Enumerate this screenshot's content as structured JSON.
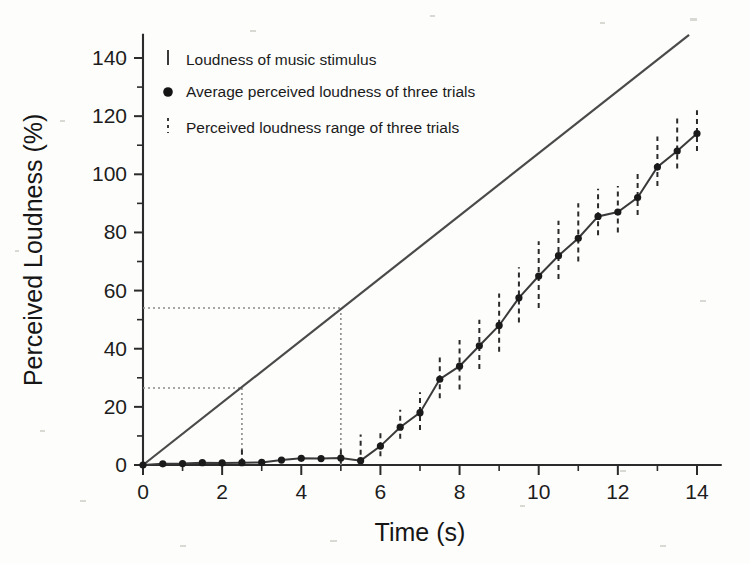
{
  "chart_data": {
    "type": "line",
    "title": "",
    "xlabel": "Time (s)",
    "ylabel": "Perceived Loudness (%)",
    "xlim": [
      0,
      14.6
    ],
    "ylim": [
      0,
      148
    ],
    "x_ticks": [
      0,
      2,
      4,
      6,
      8,
      10,
      12,
      14
    ],
    "x_tick_labels": [
      "0",
      "2",
      "4",
      "6",
      "8",
      "10",
      "12",
      "14"
    ],
    "x_minor_step": 1,
    "y_ticks": [
      0,
      20,
      40,
      60,
      80,
      100,
      120,
      140
    ],
    "y_tick_labels": [
      "0",
      "20",
      "40",
      "60",
      "80",
      "100",
      "120",
      "140"
    ],
    "y_minor_step": 10,
    "grid": false,
    "legend_position": "upper-left-inside",
    "series": [
      {
        "name": "Loudness of music stimulus",
        "type": "line",
        "style": "solid",
        "color": "#4a4a4a",
        "x": [
          0,
          13.8
        ],
        "values": [
          0,
          148
        ]
      },
      {
        "name": "Average perceived loudness of three trials",
        "type": "line-markers",
        "style": "solid-with-dots",
        "color": "#1a1a1a",
        "x": [
          0,
          0.5,
          1.0,
          1.5,
          2.0,
          2.5,
          3.0,
          3.5,
          4.0,
          4.5,
          5.0,
          5.5,
          6.0,
          6.5,
          7.0,
          7.5,
          8.0,
          8.5,
          9.0,
          9.5,
          10.0,
          10.5,
          11.0,
          11.5,
          12.0,
          12.5,
          13.0,
          13.5,
          14.0
        ],
        "values": [
          0,
          0.4,
          0.5,
          0.8,
          0.7,
          0.8,
          0.9,
          1.7,
          2.3,
          2.2,
          2.4,
          1.5,
          6.5,
          13.0,
          18.0,
          29.5,
          34.0,
          41.0,
          48.0,
          57.5,
          65.0,
          72.0,
          78.0,
          85.5,
          87.0,
          92.0,
          102.5,
          108.0,
          114.0
        ]
      },
      {
        "name": "Perceived loudness range of three trials",
        "type": "errorbar",
        "style": "dashed-vertical",
        "color": "#2a2a2a",
        "x": [
          2.5,
          5.0,
          5.5,
          6.0,
          6.5,
          7.0,
          7.5,
          8.0,
          8.5,
          9.0,
          9.5,
          10.0,
          10.5,
          11.0,
          11.5,
          12.0,
          12.5,
          13.0,
          13.5,
          14.0
        ],
        "lower": [
          0.5,
          0.5,
          3.5,
          3.0,
          9.0,
          12.0,
          23.0,
          26.0,
          33.0,
          39.0,
          49.0,
          54.0,
          64.0,
          70.0,
          79.0,
          80.0,
          86.0,
          96.0,
          102.0,
          108.0
        ],
        "upper": [
          6.0,
          6.5,
          10.5,
          11.0,
          19.0,
          25.0,
          37.0,
          43.0,
          50.0,
          59.0,
          68.0,
          77.0,
          84.0,
          90.0,
          95.0,
          96.0,
          101.0,
          113.0,
          120.0,
          122.0
        ]
      }
    ],
    "annotations": [
      {
        "name": "lower-reference",
        "type": "dotted-guide",
        "y": 26.5,
        "x": 2.5,
        "description": "Dotted guide from y-axis at 26.5% across to t = 2.5 s and down to x-axis"
      },
      {
        "name": "upper-reference",
        "type": "dotted-guide",
        "y": 54.0,
        "x": 5.0,
        "description": "Dotted guide from y-axis at 54% across to t = 5 s and down to x-axis"
      }
    ]
  },
  "legend": {
    "items": [
      {
        "marker": "vertical-line-icon",
        "label": "Loudness of music stimulus"
      },
      {
        "marker": "filled-circle-icon",
        "label": "Average perceived loudness of three trials"
      },
      {
        "marker": "dashed-vertical-line-icon",
        "label": "Perceived loudness range of three trials"
      }
    ]
  }
}
